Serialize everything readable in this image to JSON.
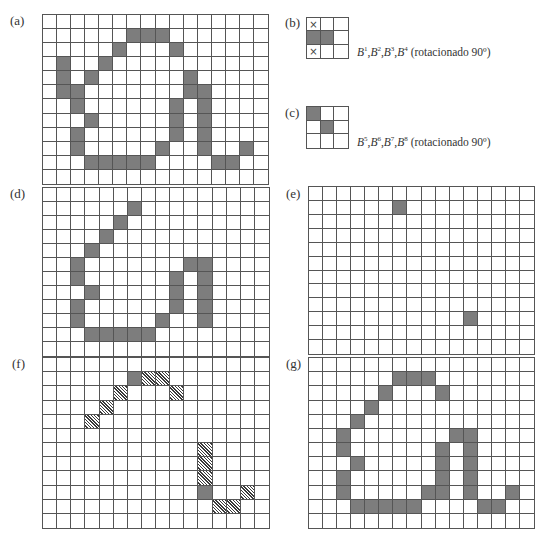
{
  "figure": {
    "colors": {
      "solid": "#7d7d7d",
      "grid_line": "#555555",
      "background": "#ffffff"
    },
    "legend": {
      "solid": "shaded pixel",
      "hatch": "hatched pixel (removed/thinned)",
      "cross": "x marked (don't care)"
    },
    "panels": [
      {
        "id": "a",
        "label": "(a)",
        "rows": 12,
        "cols": 16,
        "box": {
          "x": 42,
          "y": 14,
          "w": 227,
          "h": 171
        },
        "label_pos": {
          "x": 10,
          "y": 14
        },
        "solid": [
          [
            1,
            6
          ],
          [
            1,
            7
          ],
          [
            1,
            8
          ],
          [
            2,
            5
          ],
          [
            2,
            9
          ],
          [
            3,
            1
          ],
          [
            3,
            4
          ],
          [
            4,
            1
          ],
          [
            4,
            3
          ],
          [
            4,
            10
          ],
          [
            5,
            1
          ],
          [
            5,
            2
          ],
          [
            5,
            10
          ],
          [
            5,
            11
          ],
          [
            6,
            2
          ],
          [
            6,
            9
          ],
          [
            6,
            11
          ],
          [
            7,
            3
          ],
          [
            7,
            9
          ],
          [
            7,
            11
          ],
          [
            8,
            2
          ],
          [
            8,
            9
          ],
          [
            8,
            11
          ],
          [
            9,
            2
          ],
          [
            9,
            8
          ],
          [
            9,
            11
          ],
          [
            9,
            14
          ],
          [
            10,
            3
          ],
          [
            10,
            4
          ],
          [
            10,
            5
          ],
          [
            10,
            6
          ],
          [
            10,
            7
          ],
          [
            10,
            12
          ],
          [
            10,
            13
          ]
        ],
        "hatch": [],
        "cross": []
      },
      {
        "id": "b",
        "label": "(b)",
        "rows": 3,
        "cols": 3,
        "box": {
          "x": 306,
          "y": 17,
          "w": 43,
          "h": 42
        },
        "label_pos": {
          "x": 285,
          "y": 16
        },
        "solid": [
          [
            1,
            0
          ],
          [
            1,
            1
          ]
        ],
        "hatch": [],
        "cross": [
          [
            0,
            0
          ],
          [
            2,
            0
          ]
        ],
        "caption": {
          "base": "B",
          "supers": [
            "1",
            "2",
            "3",
            "4"
          ],
          "suffix": " (rotacionado 90º)",
          "x": 357,
          "y": 46
        }
      },
      {
        "id": "c",
        "label": "(c)",
        "rows": 3,
        "cols": 3,
        "box": {
          "x": 306,
          "y": 106,
          "w": 43,
          "h": 43
        },
        "label_pos": {
          "x": 285,
          "y": 106
        },
        "solid": [
          [
            0,
            0
          ],
          [
            1,
            1
          ]
        ],
        "hatch": [],
        "cross": [],
        "caption": {
          "base": "B",
          "supers": [
            "5",
            "6",
            "7",
            "8"
          ],
          "suffix": " (rotacionado 90º)",
          "x": 357,
          "y": 136
        }
      },
      {
        "id": "d",
        "label": "(d)",
        "rows": 12,
        "cols": 16,
        "box": {
          "x": 42,
          "y": 187,
          "w": 228,
          "h": 170
        },
        "label_pos": {
          "x": 10,
          "y": 187
        },
        "solid": [
          [
            1,
            6
          ],
          [
            2,
            5
          ],
          [
            3,
            4
          ],
          [
            4,
            3
          ],
          [
            5,
            2
          ],
          [
            5,
            10
          ],
          [
            5,
            11
          ],
          [
            6,
            2
          ],
          [
            6,
            9
          ],
          [
            6,
            11
          ],
          [
            7,
            3
          ],
          [
            7,
            9
          ],
          [
            7,
            11
          ],
          [
            8,
            2
          ],
          [
            8,
            9
          ],
          [
            8,
            11
          ],
          [
            9,
            2
          ],
          [
            9,
            8
          ],
          [
            9,
            11
          ],
          [
            10,
            3
          ],
          [
            10,
            4
          ],
          [
            10,
            5
          ],
          [
            10,
            6
          ],
          [
            10,
            7
          ]
        ],
        "hatch": [],
        "cross": []
      },
      {
        "id": "e",
        "label": "(e)",
        "rows": 12,
        "cols": 16,
        "box": {
          "x": 308,
          "y": 186,
          "w": 227,
          "h": 169
        },
        "label_pos": {
          "x": 286,
          "y": 187
        },
        "solid": [
          [
            1,
            6
          ],
          [
            9,
            11
          ]
        ],
        "hatch": [],
        "cross": []
      },
      {
        "id": "f",
        "label": "(f)",
        "rows": 12,
        "cols": 16,
        "box": {
          "x": 42,
          "y": 357,
          "w": 228,
          "h": 172
        },
        "label_pos": {
          "x": 12,
          "y": 357
        },
        "solid": [
          [
            1,
            6
          ],
          [
            9,
            11
          ]
        ],
        "hatch": [
          [
            1,
            7
          ],
          [
            1,
            8
          ],
          [
            2,
            5
          ],
          [
            2,
            9
          ],
          [
            3,
            4
          ],
          [
            4,
            3
          ],
          [
            6,
            11
          ],
          [
            7,
            11
          ],
          [
            8,
            11
          ],
          [
            9,
            14
          ],
          [
            10,
            12
          ],
          [
            10,
            13
          ]
        ],
        "cross": []
      },
      {
        "id": "g",
        "label": "(g)",
        "rows": 12,
        "cols": 16,
        "box": {
          "x": 308,
          "y": 357,
          "w": 227,
          "h": 172
        },
        "label_pos": {
          "x": 286,
          "y": 357
        },
        "solid": [
          [
            1,
            6
          ],
          [
            1,
            7
          ],
          [
            1,
            8
          ],
          [
            2,
            5
          ],
          [
            2,
            9
          ],
          [
            3,
            4
          ],
          [
            4,
            3
          ],
          [
            5,
            2
          ],
          [
            5,
            10
          ],
          [
            5,
            11
          ],
          [
            6,
            2
          ],
          [
            6,
            9
          ],
          [
            6,
            11
          ],
          [
            7,
            3
          ],
          [
            7,
            9
          ],
          [
            7,
            11
          ],
          [
            8,
            2
          ],
          [
            8,
            9
          ],
          [
            8,
            11
          ],
          [
            9,
            2
          ],
          [
            9,
            8
          ],
          [
            9,
            9
          ],
          [
            9,
            11
          ],
          [
            9,
            14
          ],
          [
            10,
            3
          ],
          [
            10,
            4
          ],
          [
            10,
            5
          ],
          [
            10,
            6
          ],
          [
            10,
            7
          ],
          [
            10,
            12
          ],
          [
            10,
            13
          ]
        ],
        "hatch": [],
        "cross": []
      }
    ]
  }
}
